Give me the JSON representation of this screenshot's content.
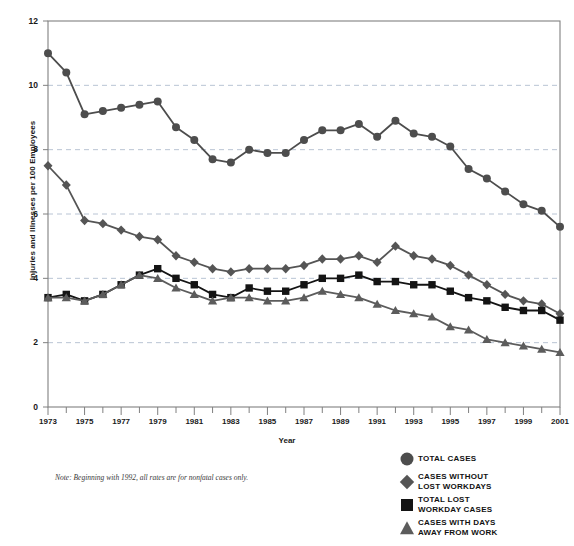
{
  "chart_data": {
    "type": "line",
    "title": "",
    "xlabel": "Year",
    "ylabel": "Injuries and Illnesses per 100 Employees",
    "xlim": [
      1973,
      2001
    ],
    "ylim": [
      0,
      12
    ],
    "ytick_labels": [
      "0",
      "2",
      "4",
      "6",
      "8",
      "10",
      "12"
    ],
    "ytick_values": [
      0,
      2,
      4,
      6,
      8,
      10,
      12
    ],
    "xtick_labels": [
      "1973",
      "1975",
      "1977",
      "1979",
      "1981",
      "1983",
      "1985",
      "1987",
      "1989",
      "1991",
      "1993",
      "1995",
      "1997",
      "1999",
      "2001"
    ],
    "xtick_values": [
      1973,
      1975,
      1977,
      1979,
      1981,
      1983,
      1985,
      1987,
      1989,
      1991,
      1993,
      1995,
      1997,
      1999,
      2001
    ],
    "grid": "horizontal-dashed",
    "legend_position": "bottom-right",
    "x": [
      1973,
      1974,
      1975,
      1976,
      1977,
      1978,
      1979,
      1980,
      1981,
      1982,
      1983,
      1984,
      1985,
      1986,
      1987,
      1988,
      1989,
      1990,
      1991,
      1992,
      1993,
      1994,
      1995,
      1996,
      1997,
      1998,
      1999,
      2000,
      2001
    ],
    "series": [
      {
        "name": "TOTAL CASES",
        "marker": "circle",
        "color": "#4d4d4d",
        "line_color": "#4d4d4d",
        "values": [
          11.0,
          10.4,
          9.1,
          9.2,
          9.3,
          9.4,
          9.5,
          8.7,
          8.3,
          7.7,
          7.6,
          8.0,
          7.9,
          7.9,
          8.3,
          8.6,
          8.6,
          8.8,
          8.4,
          8.9,
          8.5,
          8.4,
          8.1,
          7.4,
          7.1,
          6.7,
          6.3,
          6.1,
          5.6
        ]
      },
      {
        "name": "CASES WITHOUT\nLOST WORKDAYS",
        "marker": "diamond",
        "color": "#555555",
        "line_color": "#555555",
        "values": [
          7.5,
          6.9,
          5.8,
          5.7,
          5.5,
          5.3,
          5.2,
          4.7,
          4.5,
          4.3,
          4.2,
          4.3,
          4.3,
          4.3,
          4.4,
          4.6,
          4.6,
          4.7,
          4.5,
          5.0,
          4.7,
          4.6,
          4.4,
          4.1,
          3.8,
          3.5,
          3.3,
          3.2,
          2.9
        ]
      },
      {
        "name": "TOTAL LOST\nWORKDAY CASES",
        "marker": "square",
        "color": "#141414",
        "line_color": "#141414",
        "values": [
          3.4,
          3.5,
          3.3,
          3.5,
          3.8,
          4.1,
          4.3,
          4.0,
          3.8,
          3.5,
          3.4,
          3.7,
          3.6,
          3.6,
          3.8,
          4.0,
          4.0,
          4.1,
          3.9,
          3.9,
          3.8,
          3.8,
          3.6,
          3.4,
          3.3,
          3.1,
          3.0,
          3.0,
          2.7
        ]
      },
      {
        "name": "CASES WITH DAYS\nAWAY FROM WORK",
        "marker": "triangle",
        "color": "#5c5c5c",
        "line_color": "#5c5c5c",
        "values": [
          3.4,
          3.4,
          3.3,
          3.5,
          3.8,
          4.1,
          4.0,
          3.7,
          3.5,
          3.3,
          3.4,
          3.4,
          3.3,
          3.3,
          3.4,
          3.6,
          3.5,
          3.4,
          3.2,
          3.0,
          2.9,
          2.8,
          2.5,
          2.4,
          2.1,
          2.0,
          1.9,
          1.8,
          1.7
        ]
      }
    ]
  },
  "note": "Note: Beginning with 1992, all rates are for nonfatal cases only.",
  "legend": {
    "items": [
      {
        "label": "TOTAL CASES",
        "marker": "circle-icon"
      },
      {
        "label": "CASES WITHOUT\nLOST WORKDAYS",
        "marker": "diamond-icon"
      },
      {
        "label": "TOTAL LOST\nWORKDAY CASES",
        "marker": "square-icon"
      },
      {
        "label": "CASES WITH DAYS\nAWAY FROM WORK",
        "marker": "triangle-icon"
      }
    ]
  },
  "colors": {
    "axis": "#808080",
    "grid": "#b9c4d4",
    "text": "#111111",
    "background": "#ffffff"
  }
}
